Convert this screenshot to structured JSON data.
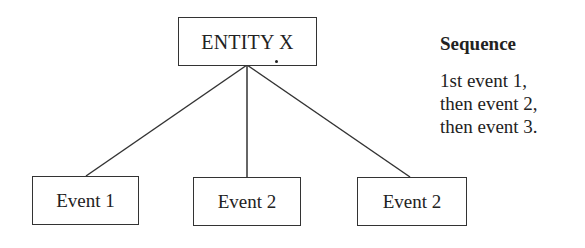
{
  "diagram": {
    "type": "tree",
    "root": {
      "label": "ENTITY X"
    },
    "children": [
      {
        "label": "Event 1"
      },
      {
        "label": "Event 2"
      },
      {
        "label": "Event 2"
      }
    ],
    "sequence": {
      "title": "Sequence",
      "lines": [
        "1st event 1,",
        "then event 2,",
        "then event 3."
      ]
    }
  },
  "colors": {
    "stroke": "#333333",
    "text": "#222222",
    "background": "#ffffff"
  }
}
